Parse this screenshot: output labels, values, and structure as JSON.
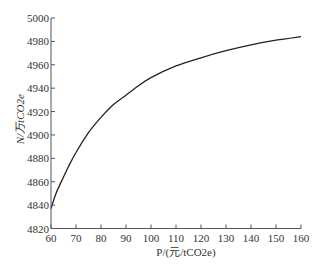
{
  "chart_data": {
    "type": "line",
    "title": "",
    "xlabel": "P/(元/tCO2e)",
    "ylabel": "N/万tCO2e",
    "xlim": [
      60,
      160
    ],
    "ylim": [
      4820,
      5000
    ],
    "xticks": [
      60,
      70,
      80,
      90,
      100,
      110,
      120,
      130,
      140,
      150,
      160
    ],
    "yticks": [
      4820,
      4840,
      4860,
      4880,
      4900,
      4920,
      4940,
      4960,
      4980,
      5000
    ],
    "grid": false,
    "legend": null,
    "series": [
      {
        "name": "N",
        "color": "#222222",
        "x": [
          60,
          62,
          65,
          67,
          70,
          75,
          80,
          85,
          90,
          95,
          100,
          110,
          120,
          130,
          140,
          150,
          160
        ],
        "y": [
          4837,
          4850,
          4864,
          4873,
          4885,
          4902,
          4915,
          4926,
          4934,
          4942,
          4949,
          4959,
          4966,
          4972,
          4977,
          4981,
          4984
        ]
      }
    ]
  }
}
